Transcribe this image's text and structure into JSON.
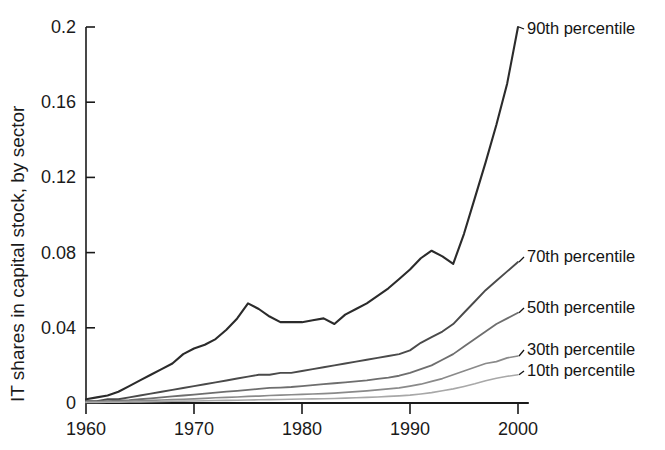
{
  "chart_data": {
    "type": "line",
    "title": "",
    "xlabel": "",
    "ylabel": "IT shares in capital stock, by sector",
    "xlim": [
      1960,
      2001
    ],
    "ylim": [
      0,
      0.2
    ],
    "grid": false,
    "legend_position": "right-inline-labels",
    "xticks": [
      1960,
      1970,
      1980,
      1990,
      2000
    ],
    "xtick_labels": [
      "1960",
      "1970",
      "1980",
      "1990",
      "2000"
    ],
    "yticks": [
      0,
      0.04,
      0.08,
      0.12,
      0.16,
      0.2
    ],
    "ytick_labels": [
      "0",
      "0.04",
      "0.08",
      "0.12",
      "0.16",
      "0.2"
    ],
    "x": [
      1960,
      1961,
      1962,
      1963,
      1964,
      1965,
      1966,
      1967,
      1968,
      1969,
      1970,
      1971,
      1972,
      1973,
      1974,
      1975,
      1976,
      1977,
      1978,
      1979,
      1980,
      1981,
      1982,
      1983,
      1984,
      1985,
      1986,
      1987,
      1988,
      1989,
      1990,
      1991,
      1992,
      1993,
      1994,
      1995,
      1996,
      1997,
      1998,
      1999,
      2000
    ],
    "series": [
      {
        "name": "90th percentile",
        "color": "#2b2b2b",
        "width": 2.1,
        "label_value": "0.200",
        "values": [
          0.002,
          0.003,
          0.004,
          0.006,
          0.009,
          0.012,
          0.015,
          0.018,
          0.021,
          0.026,
          0.029,
          0.031,
          0.034,
          0.039,
          0.045,
          0.053,
          0.05,
          0.046,
          0.043,
          0.043,
          0.043,
          0.044,
          0.045,
          0.042,
          0.047,
          0.05,
          0.053,
          0.057,
          0.061,
          0.066,
          0.071,
          0.077,
          0.081,
          0.078,
          0.074,
          0.09,
          0.109,
          0.128,
          0.148,
          0.17,
          0.2
        ]
      },
      {
        "name": "70th percentile",
        "color": "#4a4a4a",
        "width": 1.9,
        "label_value": "0.075",
        "values": [
          0.001,
          0.001,
          0.002,
          0.002,
          0.003,
          0.004,
          0.005,
          0.006,
          0.007,
          0.008,
          0.009,
          0.01,
          0.011,
          0.012,
          0.013,
          0.014,
          0.015,
          0.015,
          0.016,
          0.016,
          0.017,
          0.018,
          0.019,
          0.02,
          0.021,
          0.022,
          0.023,
          0.024,
          0.025,
          0.026,
          0.028,
          0.032,
          0.035,
          0.038,
          0.042,
          0.048,
          0.054,
          0.06,
          0.065,
          0.07,
          0.075
        ]
      },
      {
        "name": "50th percentile",
        "color": "#6e6e6e",
        "width": 1.8,
        "label_value": "0.048",
        "values": [
          0.0008,
          0.0009,
          0.001,
          0.0012,
          0.0015,
          0.002,
          0.0025,
          0.003,
          0.0035,
          0.004,
          0.0045,
          0.005,
          0.0055,
          0.006,
          0.0065,
          0.007,
          0.0075,
          0.008,
          0.0082,
          0.0085,
          0.009,
          0.0095,
          0.01,
          0.0105,
          0.011,
          0.0115,
          0.012,
          0.0128,
          0.0135,
          0.0145,
          0.016,
          0.018,
          0.02,
          0.023,
          0.026,
          0.03,
          0.034,
          0.038,
          0.042,
          0.045,
          0.048
        ]
      },
      {
        "name": "30th percentile",
        "color": "#8a8a8a",
        "width": 1.7,
        "label_value": "0.025",
        "values": [
          0.0005,
          0.0006,
          0.0007,
          0.0008,
          0.001,
          0.0012,
          0.0014,
          0.0016,
          0.0018,
          0.002,
          0.0022,
          0.0025,
          0.0028,
          0.003,
          0.0032,
          0.0035,
          0.0037,
          0.004,
          0.0042,
          0.0044,
          0.0046,
          0.0048,
          0.005,
          0.0053,
          0.0056,
          0.006,
          0.0065,
          0.007,
          0.0075,
          0.008,
          0.009,
          0.01,
          0.0115,
          0.013,
          0.015,
          0.017,
          0.019,
          0.021,
          0.022,
          0.024,
          0.025
        ]
      },
      {
        "name": "10th percentile",
        "color": "#a8a8a8",
        "width": 1.6,
        "label_value": "0.015",
        "values": [
          0.0003,
          0.0003,
          0.0004,
          0.0004,
          0.0005,
          0.0006,
          0.0007,
          0.0008,
          0.0009,
          0.001,
          0.0011,
          0.0012,
          0.0013,
          0.0014,
          0.0015,
          0.0016,
          0.0017,
          0.0018,
          0.0019,
          0.002,
          0.0021,
          0.0022,
          0.0023,
          0.0024,
          0.0026,
          0.0028,
          0.003,
          0.0032,
          0.0035,
          0.0038,
          0.0042,
          0.0048,
          0.0055,
          0.0065,
          0.0075,
          0.0088,
          0.0102,
          0.0118,
          0.0132,
          0.0142,
          0.015
        ]
      }
    ],
    "annotations": [
      {
        "text": "90th percentile",
        "x": 2000,
        "y": 0.2
      },
      {
        "text": "70th percentile",
        "x": 2000,
        "y": 0.075
      },
      {
        "text": "50th percentile",
        "x": 2000,
        "y": 0.048
      },
      {
        "text": "30th percentile",
        "x": 2000,
        "y": 0.025
      },
      {
        "text": "10th percentile",
        "x": 2000,
        "y": 0.015
      }
    ]
  }
}
